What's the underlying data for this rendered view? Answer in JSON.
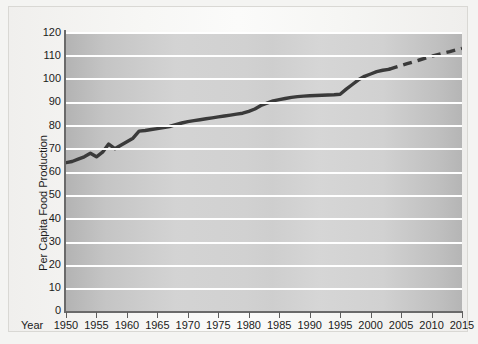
{
  "chart_data": {
    "type": "line",
    "title": "",
    "xlabel": "Year",
    "ylabel": "Per Capita Food Production",
    "xlim": [
      1950,
      2015
    ],
    "ylim": [
      0,
      120
    ],
    "grid": true,
    "legend": "none",
    "x_tick_labels": [
      "1950",
      "1955",
      "1960",
      "1965",
      "1970",
      "1975",
      "1980",
      "1985",
      "1990",
      "1995",
      "2000",
      "2005",
      "2010",
      "2015"
    ],
    "x_ticks": [
      1950,
      1955,
      1960,
      1965,
      1970,
      1975,
      1980,
      1985,
      1990,
      1995,
      2000,
      2005,
      2010,
      2015
    ],
    "y_tick_labels": [
      "0",
      "10",
      "20",
      "30",
      "40",
      "50",
      "60",
      "70",
      "80",
      "90",
      "100",
      "110",
      "120"
    ],
    "y_ticks": [
      0,
      10,
      20,
      30,
      40,
      50,
      60,
      70,
      80,
      90,
      100,
      110,
      120
    ],
    "series": [
      {
        "name": "Per Capita Food Production (historical)",
        "style": "solid",
        "color": "#3a3a3a",
        "x": [
          1950,
          1951,
          1952,
          1953,
          1954,
          1955,
          1956,
          1957,
          1958,
          1959,
          1960,
          1961,
          1962,
          1963,
          1964,
          1965,
          1966,
          1967,
          1968,
          1969,
          1970,
          1971,
          1972,
          1973,
          1974,
          1975,
          1976,
          1977,
          1978,
          1979,
          1980,
          1981,
          1982,
          1983,
          1984,
          1985,
          1986,
          1987,
          1988,
          1989,
          1990,
          1991,
          1992,
          1993,
          1994,
          1995,
          1996,
          1997,
          1998,
          1999,
          2000,
          2001,
          2002,
          2003
        ],
        "values": [
          64,
          64.5,
          65.5,
          66.5,
          68,
          66.5,
          68.5,
          72,
          70,
          71.5,
          73,
          74.5,
          77.5,
          77.8,
          78.2,
          78.6,
          79,
          79.5,
          80.3,
          81,
          81.6,
          82,
          82.4,
          82.8,
          83.2,
          83.6,
          84,
          84.4,
          84.8,
          85.2,
          86,
          87,
          88.5,
          89.5,
          90.5,
          91,
          91.5,
          92,
          92.3,
          92.5,
          92.7,
          92.8,
          92.9,
          93,
          93.1,
          93.3,
          95.5,
          97.5,
          99.5,
          101,
          102,
          103,
          103.6,
          104
        ]
      },
      {
        "name": "Per Capita Food Production (projection)",
        "style": "dashed",
        "color": "#3a3a3a",
        "x": [
          2003,
          2004,
          2005,
          2006,
          2007,
          2008,
          2009,
          2010,
          2011,
          2012,
          2013,
          2014,
          2015
        ],
        "values": [
          104,
          104.8,
          105.6,
          106.4,
          107.2,
          108,
          108.8,
          109.6,
          110.3,
          111,
          111.6,
          112.3,
          113
        ]
      }
    ]
  }
}
